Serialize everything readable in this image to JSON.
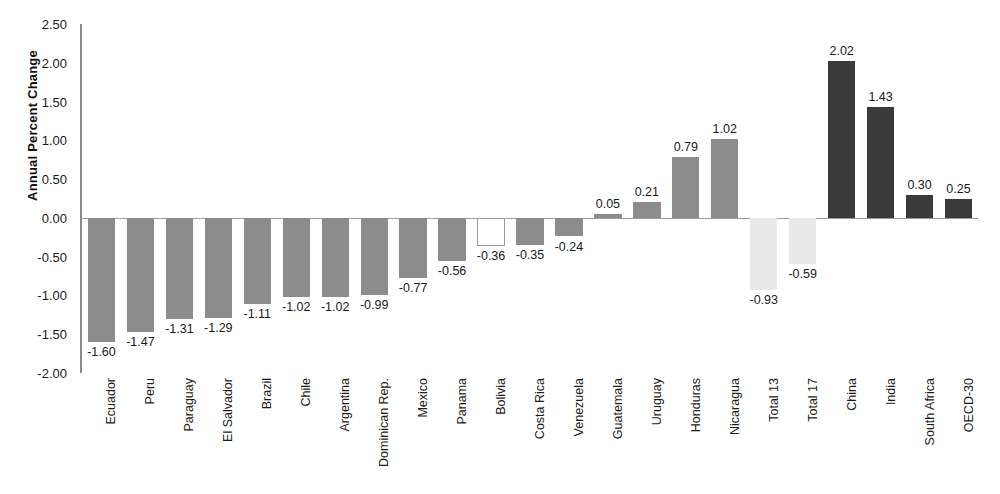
{
  "chart_data": {
    "type": "bar",
    "title": "",
    "subtitle": "",
    "xlabel": "",
    "ylabel": "Annual Percent Change",
    "ylim": [
      -2.0,
      2.5
    ],
    "ytick_labels": [
      "2.50",
      "2.00",
      "1.50",
      "1.00",
      "0.50",
      "0.00",
      "-0.50",
      "-1.00",
      "-1.50",
      "-2.00"
    ],
    "ytick_values": [
      2.5,
      2.0,
      1.5,
      1.0,
      0.5,
      0.0,
      -0.5,
      -1.0,
      -1.5,
      -2.0
    ],
    "grid": false,
    "legend": "none",
    "categories": [
      "Ecuador",
      "Peru",
      "Paraguay",
      "El Salvador",
      "Brazil",
      "Chile",
      "Argentina",
      "Dominican Rep.",
      "Mexico",
      "Panama",
      "Bolivia",
      "Costa Rica",
      "Venezuela",
      "Guatemala",
      "Uruguay",
      "Honduras",
      "Nicaragua",
      "Total 13",
      "Total 17",
      "China",
      "India",
      "South Africa",
      "OECD-30"
    ],
    "values": [
      -1.6,
      -1.47,
      -1.31,
      -1.29,
      -1.11,
      -1.02,
      -1.02,
      -0.99,
      -0.77,
      -0.56,
      -0.36,
      -0.35,
      -0.24,
      0.05,
      0.21,
      0.79,
      1.02,
      -0.93,
      -0.59,
      2.02,
      1.43,
      0.3,
      0.25
    ],
    "value_labels": [
      "-1.60",
      "-1.47",
      "-1.31",
      "-1.29",
      "-1.11",
      "-1.02",
      "-1.02",
      "-0.99",
      "-0.77",
      "-0.56",
      "-0.36",
      "-0.35",
      "-0.24",
      "0.05",
      "0.21",
      "0.79",
      "1.02",
      "-0.93",
      "-0.59",
      "2.02",
      "1.43",
      "0.30",
      "0.25"
    ],
    "bar_styles": [
      "medium",
      "medium",
      "medium",
      "medium",
      "medium",
      "medium",
      "medium",
      "medium",
      "medium",
      "medium",
      "hollow",
      "medium",
      "medium",
      "medium",
      "medium",
      "medium",
      "medium",
      "light",
      "light",
      "dark",
      "dark",
      "dark",
      "dark"
    ],
    "colors": {
      "medium": "#8c8c8c",
      "dark": "#3a3a3a",
      "light": "#e9e9e9",
      "hollow": "#ffffff",
      "hollow_outline": "#9a9a9a",
      "axis": "#8a8a8a",
      "text": "#1a1a1a"
    }
  }
}
